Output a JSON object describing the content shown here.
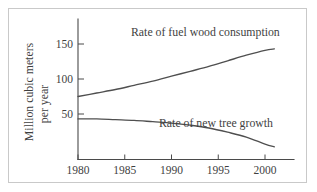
{
  "chart_data": {
    "type": "line",
    "title": "",
    "xlabel": "",
    "ylabel_line1": "Million cubic meters",
    "ylabel_line2": "per year",
    "xlim": [
      1980,
      2003.5
    ],
    "ylim": [
      -14,
      171
    ],
    "grid": false,
    "legend_position": "inline-annotations",
    "xticks": [
      1980,
      1985,
      1990,
      1995,
      2000
    ],
    "xtick_labels": [
      "1980",
      "1985",
      "1990",
      "1995",
      "2000"
    ],
    "yticks": [
      50,
      100,
      150
    ],
    "ytick_labels": [
      "50",
      "100",
      "150"
    ],
    "series": [
      {
        "name": "Rate of fuel wood consumption",
        "annotation": "Rate of fuel wood consumption",
        "x": [
          1980,
          1982,
          1984,
          1986,
          1988,
          1990,
          1992,
          1994,
          1996,
          1998,
          2000,
          2001
        ],
        "values": [
          75,
          80,
          85,
          91,
          97,
          104,
          111,
          118,
          126,
          134,
          141,
          143
        ]
      },
      {
        "name": "Rate of new tree growth",
        "annotation": "Rate of new tree growth",
        "x": [
          1980,
          1982,
          1984,
          1986,
          1988,
          1990,
          1992,
          1994,
          1996,
          1998,
          2000,
          2001
        ],
        "values": [
          43,
          43,
          42,
          41,
          39,
          37,
          34,
          30,
          24,
          17,
          7,
          3
        ]
      }
    ],
    "colors": {
      "curve": "#4f4f4f",
      "axis": "#4a4a4a",
      "text": "#3f3f3f",
      "frame": "#c9c9c9",
      "background": "#ffffff"
    }
  }
}
